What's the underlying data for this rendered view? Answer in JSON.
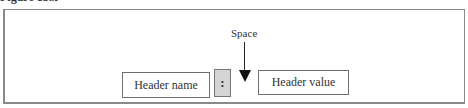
{
  "caption": "Figure 13.x",
  "diagram": {
    "space_label": "Space",
    "header_name": "Header name",
    "separator": ":",
    "header_value": "Header value"
  }
}
